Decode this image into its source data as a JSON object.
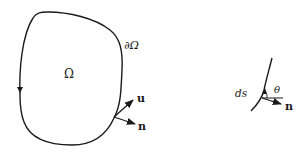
{
  "main_figure": {
    "region_label": "Ω",
    "boundary_label": "∂Ω",
    "vector_u_label": "u",
    "vector_n_label": "n"
  },
  "inset_figure": {
    "arc_length_label": "ds",
    "angle_label": "θ",
    "normal_label": "n"
  },
  "colors": {
    "stroke": "#1a1a1a",
    "background": "#ffffff"
  }
}
